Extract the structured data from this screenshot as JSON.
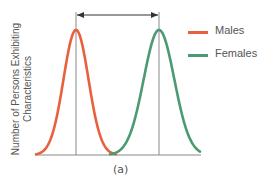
{
  "chart_data": {
    "type": "line",
    "title": "",
    "caption": "(a)",
    "xlabel": "",
    "ylabel": "Number of Persons Exhibiting Characteristics",
    "ylabel_lines": [
      "Number of Persons Exhibiting",
      "Characteristics"
    ],
    "grid": false,
    "legend_position": "right",
    "series": [
      {
        "name": "Males",
        "color": "#e8603c",
        "distribution": "normal",
        "mean_px": 76,
        "peak_px_y": 30,
        "base_left_px": 36,
        "base_right_px": 116
      },
      {
        "name": "Females",
        "color": "#4a9a72",
        "distribution": "normal",
        "mean_px": 159,
        "peak_px_y": 30,
        "base_left_px": 110,
        "base_right_px": 200
      }
    ],
    "annotations": [
      {
        "type": "double-arrow",
        "from": "Males mean",
        "to": "Females mean",
        "meaning": "difference between means"
      },
      {
        "type": "vline",
        "at": "Males mean"
      },
      {
        "type": "vline",
        "at": "Females mean"
      }
    ]
  },
  "legend": {
    "items": [
      {
        "label": "Males",
        "color": "#e8603c"
      },
      {
        "label": "Females",
        "color": "#4a9a72"
      }
    ]
  },
  "axis": {
    "ylabel_line1": "Number of Persons Exhibiting",
    "ylabel_line2": "Characteristics"
  },
  "caption": "(a)",
  "colors": {
    "axis": "#8a8a8a",
    "arrow": "#333333"
  }
}
